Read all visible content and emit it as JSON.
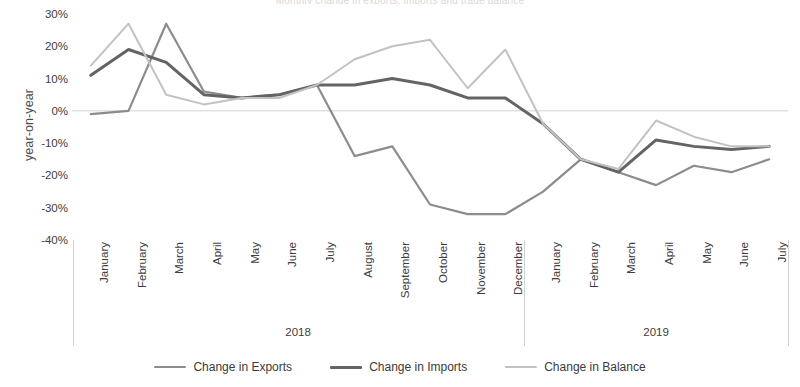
{
  "chart_data": {
    "type": "line",
    "title": "Monthly change in exports, imports and trade balance",
    "xlabel": "",
    "ylabel": "year-on-year",
    "ylim": [
      -40,
      30
    ],
    "ytick_step": 10,
    "ytick_labels": [
      "30%",
      "20%",
      "10%",
      "0%",
      "-10%",
      "-20%",
      "-30%",
      "-40%"
    ],
    "ytick_values": [
      30,
      20,
      10,
      0,
      -10,
      -20,
      -30,
      -40
    ],
    "grid": false,
    "zero_line": true,
    "legend_position": "bottom",
    "categories": [
      "January",
      "February",
      "March",
      "April",
      "May",
      "June",
      "July",
      "August",
      "September",
      "October",
      "November",
      "December",
      "January",
      "February",
      "March",
      "April",
      "May",
      "June",
      "July"
    ],
    "group_labels": [
      {
        "label": "2018",
        "start_index": 0,
        "end_index": 11
      },
      {
        "label": "2019",
        "start_index": 12,
        "end_index": 18
      }
    ],
    "series": [
      {
        "name": "Change in Exports",
        "color": "#8c8c8c",
        "width": 2.2,
        "values": [
          -1,
          0,
          27,
          6,
          4,
          5,
          8,
          -14,
          -11,
          -29,
          -32,
          -32,
          -25,
          -15,
          -19,
          -23,
          -17,
          -19,
          -15
        ]
      },
      {
        "name": "Change in Imports",
        "color": "#646464",
        "width": 3.0,
        "values": [
          11,
          19,
          15,
          5,
          4,
          5,
          8,
          8,
          10,
          8,
          4,
          4,
          -4,
          -15,
          -19,
          -9,
          -11,
          -12,
          -11
        ]
      },
      {
        "name": "Change in Balance",
        "color": "#c2c2c2",
        "width": 2.0,
        "values": [
          14,
          27,
          5,
          2,
          4,
          4,
          8,
          16,
          20,
          22,
          7,
          19,
          -4,
          -15,
          -18,
          -3,
          -8,
          -11,
          -11
        ]
      }
    ]
  },
  "axis": {
    "y_title": "year-on-year"
  },
  "colors": {
    "exports": "#8c8c8c",
    "imports": "#646464",
    "balance": "#c2c2c2",
    "axis": "#d2d2d2",
    "text": "#3d3d3d"
  }
}
